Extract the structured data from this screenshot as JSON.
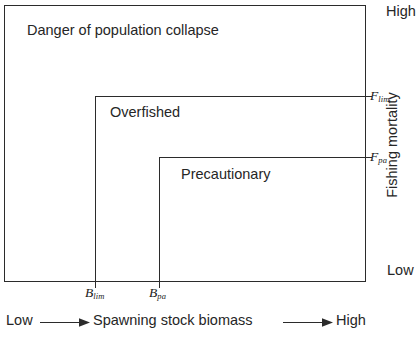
{
  "diagram": {
    "type": "fisheries-precautionary-approach-schematic",
    "regions": [
      {
        "id": "collapse",
        "label": "Danger of population collapse"
      },
      {
        "id": "overfished",
        "label": "Overfished"
      },
      {
        "id": "precautionary",
        "label": "Precautionary"
      }
    ],
    "thresholds": {
      "f_lim": {
        "symbol": "F",
        "subscript": "lim",
        "axis": "y"
      },
      "f_pa": {
        "symbol": "F",
        "subscript": "pa",
        "axis": "y"
      },
      "b_lim": {
        "symbol": "B",
        "subscript": "lim",
        "axis": "x"
      },
      "b_pa": {
        "symbol": "B",
        "subscript": "pa",
        "axis": "x"
      }
    },
    "y_axis": {
      "title": "Fishing mortality",
      "high_label": "High",
      "low_label": "Low",
      "direction": "low-at-bottom-high-at-top"
    },
    "x_axis": {
      "title": "Spawning stock biomass",
      "low_label": "Low",
      "high_label": "High",
      "direction": "low-at-left-high-at-right"
    },
    "colors": {
      "line": "#2b2b2b",
      "text": "#262626",
      "background": "#ffffff"
    }
  }
}
